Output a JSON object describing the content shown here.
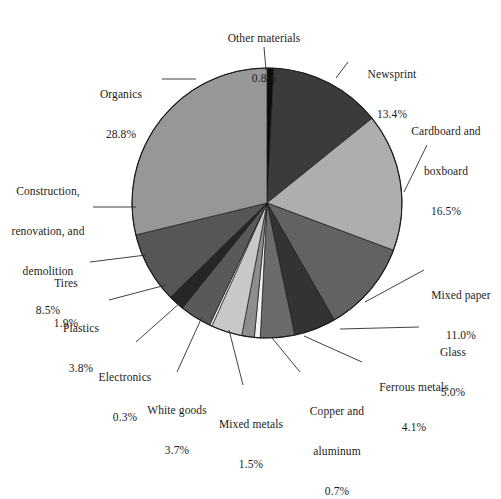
{
  "chart_data": {
    "type": "pie",
    "title": "",
    "subtitle": "",
    "xlabel": "",
    "ylabel": "",
    "legend_position": "callout-labels",
    "grid": false,
    "units": "percent",
    "total": 100.0,
    "start_angle_deg": -90,
    "direction": "clockwise",
    "categories": [
      "Other materials",
      "Newsprint",
      "Cardboard and boxboard",
      "Mixed paper",
      "Glass",
      "Ferrous metals",
      "Copper and aluminum",
      "Mixed metals",
      "White goods",
      "Electronics",
      "Plastics",
      "Tires",
      "Construction, renovation, and demolition",
      "Organics"
    ],
    "values": [
      0.8,
      13.4,
      16.5,
      11.0,
      5.0,
      4.1,
      0.7,
      1.5,
      3.7,
      0.3,
      3.8,
      1.9,
      8.5,
      28.8
    ],
    "slice_colors": [
      "#0c0c0c",
      "#3b3b3b",
      "#aeaeae",
      "#626262",
      "#333333",
      "#6b6b6b",
      "#f2f2f2",
      "#8d8d8d",
      "#c8c8c8",
      "#ededed",
      "#595959",
      "#262626",
      "#565656",
      "#979797"
    ],
    "slices": [
      {
        "label": "Other materials",
        "value": 0.8,
        "value_text": "0.8%",
        "color": "#0c0c0c"
      },
      {
        "label": "Newsprint",
        "value": 13.4,
        "value_text": "13.4%",
        "color": "#3b3b3b"
      },
      {
        "label": "Cardboard and boxboard",
        "value": 16.5,
        "value_text": "16.5%",
        "color": "#aeaeae"
      },
      {
        "label": "Mixed paper",
        "value": 11.0,
        "value_text": "11.0%",
        "color": "#626262"
      },
      {
        "label": "Glass",
        "value": 5.0,
        "value_text": "5.0%",
        "color": "#333333"
      },
      {
        "label": "Ferrous metals",
        "value": 4.1,
        "value_text": "4.1%",
        "color": "#6b6b6b"
      },
      {
        "label": "Copper and aluminum",
        "value": 0.7,
        "value_text": "0.7%",
        "color": "#f2f2f2"
      },
      {
        "label": "Mixed metals",
        "value": 1.5,
        "value_text": "1.5%",
        "color": "#8d8d8d"
      },
      {
        "label": "White goods",
        "value": 3.7,
        "value_text": "3.7%",
        "color": "#c8c8c8"
      },
      {
        "label": "Electronics",
        "value": 0.3,
        "value_text": "0.3%",
        "color": "#ededed"
      },
      {
        "label": "Plastics",
        "value": 3.8,
        "value_text": "3.8%",
        "color": "#595959"
      },
      {
        "label": "Tires",
        "value": 1.9,
        "value_text": "1.9%",
        "color": "#262626"
      },
      {
        "label": "Construction, renovation, and demolition",
        "value": 8.5,
        "value_text": "8.5%",
        "color": "#565656"
      },
      {
        "label": "Organics",
        "value": 28.8,
        "value_text": "28.8%",
        "color": "#979797"
      }
    ]
  },
  "labels": {
    "other_materials": {
      "name": "Other materials",
      "pct": "0.8%"
    },
    "newsprint": {
      "name": "Newsprint",
      "pct": "13.4%"
    },
    "cardboard": {
      "name_line1": "Cardboard and",
      "name_line2": "boxboard",
      "pct": "16.5%"
    },
    "mixed_paper": {
      "name": "Mixed paper",
      "pct": "11.0%"
    },
    "glass": {
      "name": "Glass",
      "pct": "5.0%"
    },
    "ferrous_metals": {
      "name": "Ferrous metals",
      "pct": "4.1%"
    },
    "copper_aluminum": {
      "name_line1": "Copper and",
      "name_line2": "aluminum",
      "pct": "0.7%"
    },
    "mixed_metals": {
      "name": "Mixed metals",
      "pct": "1.5%"
    },
    "white_goods": {
      "name": "White goods",
      "pct": "3.7%"
    },
    "electronics": {
      "name": "Electronics",
      "pct": "0.3%"
    },
    "plastics": {
      "name": "Plastics",
      "pct": "3.8%"
    },
    "tires": {
      "name": "Tires",
      "pct": "1.9%"
    },
    "construction": {
      "name_line1": "Construction,",
      "name_line2": "renovation, and",
      "name_line3": "demolition",
      "pct": "8.5%"
    },
    "organics": {
      "name": "Organics",
      "pct": "28.8%"
    }
  },
  "geometry": {
    "center_x": 267,
    "center_y": 203,
    "radius": 135
  },
  "colors": {
    "background": "#ffffff",
    "text": "#1c1c1c",
    "leader_line": "#2b2b2b",
    "slice_outline": "#1a1a1a"
  }
}
